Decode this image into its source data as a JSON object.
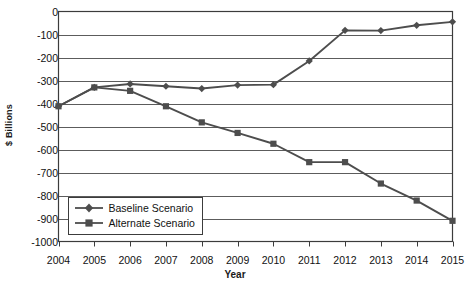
{
  "chart_data": {
    "type": "line",
    "title": "",
    "xlabel": "Year",
    "ylabel": "$ Billions",
    "categories": [
      2004,
      2005,
      2006,
      2007,
      2008,
      2009,
      2010,
      2011,
      2012,
      2013,
      2014,
      2015
    ],
    "xtick_labels": [
      "2004",
      "2005",
      "2006",
      "2007",
      "2008",
      "2009",
      "2010",
      "2011",
      "2012",
      "2013",
      "2014",
      "2015"
    ],
    "ytick_labels": [
      "0",
      "-100",
      "-200",
      "-300",
      "-400",
      "-500",
      "-600",
      "-700",
      "-800",
      "-900",
      "-1000"
    ],
    "ytick_values": [
      0,
      -100,
      -200,
      -300,
      -400,
      -500,
      -600,
      -700,
      -800,
      -900,
      -1000
    ],
    "ylim": [
      -1000,
      0
    ],
    "xlim": [
      2004,
      2015
    ],
    "grid": true,
    "legend_position": "bottom-left",
    "series": [
      {
        "name": "Baseline Scenario",
        "marker": "diamond",
        "color": "#4d4d4d",
        "values": [
          -412,
          -330,
          -315,
          -325,
          -335,
          -320,
          -318,
          -215,
          -82,
          -83,
          -60,
          -45
        ]
      },
      {
        "name": "Alternate Scenario",
        "marker": "square",
        "color": "#4d4d4d",
        "values": [
          -412,
          -330,
          -345,
          -412,
          -482,
          -528,
          -575,
          -655,
          -655,
          -748,
          -822,
          -910
        ]
      }
    ]
  },
  "legend": {
    "items": [
      {
        "label": "Baseline Scenario"
      },
      {
        "label": "Alternate Scenario"
      }
    ]
  },
  "axes": {
    "x_title": "Year",
    "y_title": "$ Billions"
  }
}
